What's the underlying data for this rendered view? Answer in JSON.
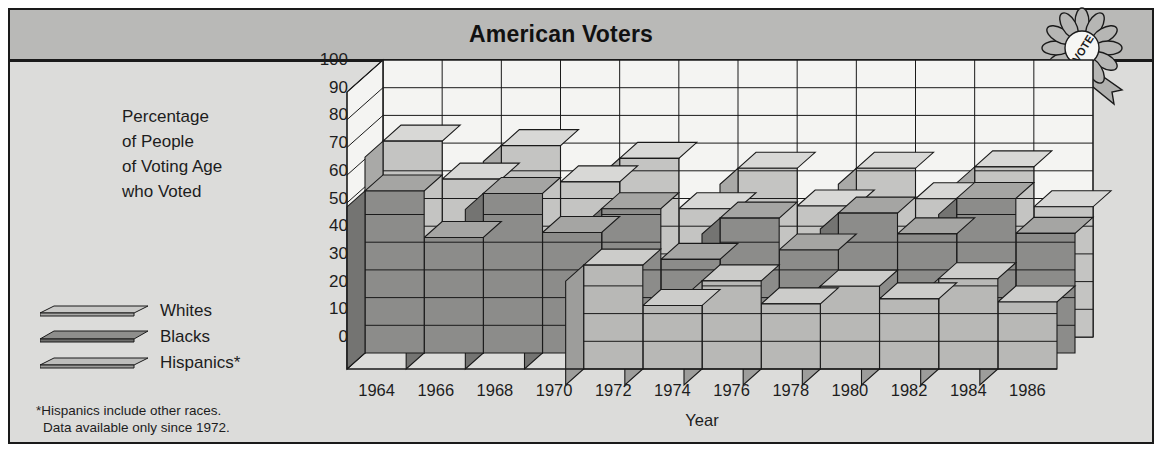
{
  "header": {
    "title": "American Voters",
    "badge_icon": "vote-rosette-icon",
    "badge_text": "VOTE"
  },
  "axis_label_lines": [
    "Percentage",
    "of People",
    "of Voting Age",
    "who Voted"
  ],
  "legend": [
    {
      "label": "Whites",
      "key": "whites",
      "color": "#c9c9c7"
    },
    {
      "label": "Blacks",
      "key": "blacks",
      "color": "#8e8e8c"
    },
    {
      "label": "Hispanics*",
      "key": "hispanics",
      "color": "#bdbdbb"
    }
  ],
  "footnote_lines": [
    "*Hispanics include other races.",
    "Data available only since 1972."
  ],
  "colors": {
    "page_background": "#ffffff",
    "panel_background": "#dcdcda",
    "titlebar_background": "#b9b9b7",
    "plot_background": "#f4f4f2",
    "ink": "#1a1a1a",
    "whites_front": "#c4c4c2",
    "whites_top": "#d8d8d6",
    "whites_side": "#a9a9a7",
    "blacks_front": "#8c8c8a",
    "blacks_top": "#a5a5a3",
    "blacks_side": "#747472",
    "hispanics_front": "#b8b8b6",
    "hispanics_top": "#cccccA",
    "hispanics_side": "#9d9d9b"
  },
  "chart_data": {
    "type": "bar",
    "title": "American Voters",
    "xlabel": "Year",
    "ylabel": "Percentage of People of Voting Age who Voted",
    "ylim": [
      0,
      100
    ],
    "yticks": [
      0,
      10,
      20,
      30,
      40,
      50,
      60,
      70,
      80,
      90,
      100
    ],
    "grid": true,
    "legend_position": "left",
    "categories": [
      "1964",
      "1966",
      "1968",
      "1970",
      "1972",
      "1974",
      "1976",
      "1978",
      "1980",
      "1982",
      "1984",
      "1986"
    ],
    "series": [
      {
        "name": "Whites",
        "values": [
          70.7,
          57.0,
          69.1,
          56.0,
          64.5,
          46.3,
          60.9,
          47.3,
          60.9,
          49.9,
          61.4,
          47.0
        ]
      },
      {
        "name": "Blacks",
        "values": [
          58.5,
          41.7,
          57.6,
          43.5,
          52.1,
          33.8,
          48.7,
          37.2,
          50.5,
          43.0,
          55.8,
          43.2
        ]
      },
      {
        "name": "Hispanics*",
        "values": [
          null,
          null,
          null,
          null,
          37.5,
          22.9,
          31.8,
          23.5,
          29.9,
          25.3,
          32.6,
          24.2
        ]
      }
    ],
    "notes": [
      "*Hispanics include other races.",
      "Data available only since 1972."
    ]
  }
}
